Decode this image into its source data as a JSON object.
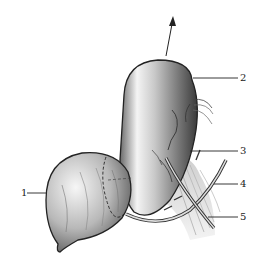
{
  "figure": {
    "type": "anatomical-illustration",
    "labels": [
      {
        "id": "1",
        "text": "1",
        "x": 22,
        "y": 188
      },
      {
        "id": "2",
        "text": "2",
        "x": 240,
        "y": 73
      },
      {
        "id": "3",
        "text": "3",
        "x": 240,
        "y": 145
      },
      {
        "id": "4",
        "text": "4",
        "x": 240,
        "y": 178
      },
      {
        "id": "5",
        "text": "5",
        "x": 240,
        "y": 212
      }
    ],
    "arrow": {
      "direction": "up",
      "from": [
        166,
        56
      ],
      "to": [
        173,
        18
      ]
    },
    "colors": {
      "ink": "#222222",
      "shade_dark": "#555555",
      "shade_mid": "#999999",
      "background": "#ffffff"
    }
  }
}
